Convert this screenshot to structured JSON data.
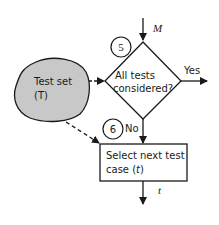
{
  "diagram": {
    "type": "flowchart",
    "nodes": {
      "test_set": {
        "line1": "Test set",
        "line2": "(T)",
        "shape": "blob",
        "fill": "#c8c8c8"
      },
      "decision": {
        "line1": "All tests",
        "line2": "considered?",
        "shape": "diamond",
        "step": "5"
      },
      "select": {
        "line1": "Select next test",
        "line2_prefix": "case (",
        "line2_var": "t",
        "line2_suffix": ")",
        "shape": "rectangle",
        "step": "6"
      }
    },
    "edges": {
      "input_label": "M",
      "yes_label": "Yes",
      "no_label": "No",
      "output_label": "t"
    },
    "colors": {
      "stroke": "#1a1a1a",
      "blob_fill": "#c8c8c8",
      "background": "#ffffff"
    }
  }
}
